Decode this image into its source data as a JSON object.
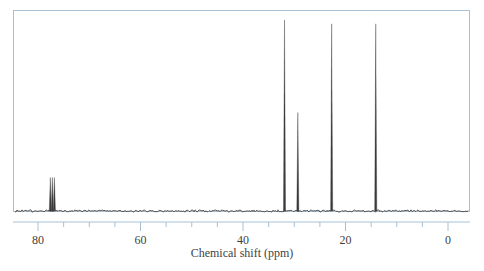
{
  "figure": {
    "kind": "nmr-spectrum",
    "frame_color": "#a8c0d4",
    "trace_color": "#3a3a3a",
    "baseline_color": "#4a4a4a",
    "background": "#ffffff"
  },
  "axis": {
    "title": "Chemical shift (ppm)",
    "tick_labels": [
      "80",
      "60",
      "40",
      "20",
      "0"
    ],
    "major_ticks": [
      80,
      60,
      40,
      20,
      0
    ],
    "minor_step": 5,
    "direction": "reversed",
    "range_ppm": [
      85,
      -3
    ]
  },
  "chart_data": {
    "type": "line",
    "title": "",
    "xlabel": "Chemical shift (ppm)",
    "ylabel": "",
    "xlim": [
      85,
      -3
    ],
    "ylim": [
      0,
      100
    ],
    "grid": false,
    "legend": "none",
    "x_axis_reversed": true,
    "peaks": [
      {
        "ppm": 77.6,
        "intensity": 17,
        "label": "CDCl3-a"
      },
      {
        "ppm": 77.2,
        "intensity": 17,
        "label": "CDCl3-b"
      },
      {
        "ppm": 76.8,
        "intensity": 17,
        "label": "CDCl3-c"
      },
      {
        "ppm": 31.9,
        "intensity": 97,
        "label": "C"
      },
      {
        "ppm": 29.3,
        "intensity": 50,
        "label": "C"
      },
      {
        "ppm": 22.7,
        "intensity": 95,
        "label": "C"
      },
      {
        "ppm": 14.1,
        "intensity": 95,
        "label": "C"
      }
    ]
  }
}
